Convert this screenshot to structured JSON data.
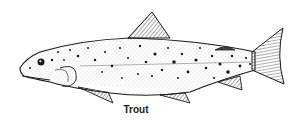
{
  "figure": {
    "caption": "Trout",
    "colors": {
      "ink": "#1a1a1a",
      "background": "#ffffff"
    }
  }
}
